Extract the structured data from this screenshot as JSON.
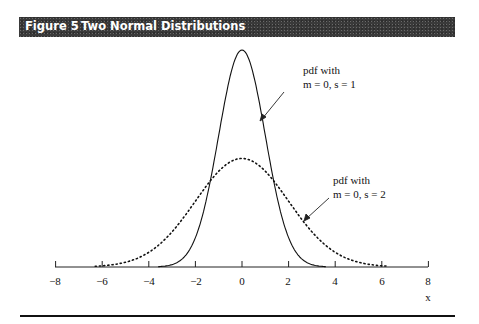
{
  "header": {
    "figure_label": "Figure 5",
    "title": "Two Normal Distributions",
    "bg_color": "#3a3a3a"
  },
  "annotations": [
    {
      "line1": "pdf with",
      "line2": "m = 0, s = 1"
    },
    {
      "line1": "pdf with",
      "line2": "m = 0, s = 2"
    }
  ],
  "axis": {
    "xlabel": "x",
    "ticks": [
      "−8",
      "−6",
      "−4",
      "−2",
      "0",
      "2",
      "4",
      "6",
      "8"
    ]
  },
  "chart_data": {
    "type": "line",
    "title": "Two Normal Distributions",
    "xlabel": "x",
    "ylabel": "",
    "xlim": [
      -8,
      8
    ],
    "x_ticks": [
      -8,
      -6,
      -4,
      -2,
      0,
      2,
      4,
      6,
      8
    ],
    "grid": false,
    "legend_position": "annotations with arrows",
    "series": [
      {
        "name": "pdf with m = 0, s = 1",
        "style": "solid",
        "mean": 0,
        "sd": 1,
        "x": [
          -4,
          -3,
          -2,
          -1,
          0,
          1,
          2,
          3,
          4
        ],
        "values": [
          0.0001,
          0.0044,
          0.054,
          0.242,
          0.399,
          0.242,
          0.054,
          0.0044,
          0.0001
        ]
      },
      {
        "name": "pdf with m = 0, s = 2",
        "style": "dotted",
        "mean": 0,
        "sd": 2,
        "x": [
          -6,
          -4,
          -2,
          0,
          2,
          4,
          6
        ],
        "values": [
          0.0022,
          0.027,
          0.121,
          0.199,
          0.121,
          0.027,
          0.0022
        ]
      }
    ]
  }
}
